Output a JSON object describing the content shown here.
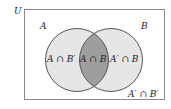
{
  "diagram": {
    "type": "venn",
    "universe_label": "U",
    "sets": [
      {
        "name": "A",
        "label": "A"
      },
      {
        "name": "B",
        "label": "B"
      }
    ],
    "regions": {
      "a_only": "A ∩ B′",
      "intersection": "A ∩ B",
      "b_only": "A′ ∩ B",
      "neither": "A′ ∩ B′"
    },
    "colors": {
      "frame": "#8a8a8a",
      "background": "#ffffff",
      "circle_fill": "#e6e6e6",
      "circle_stroke": "#555555",
      "intersection_fill": "#9e9e9e"
    }
  }
}
